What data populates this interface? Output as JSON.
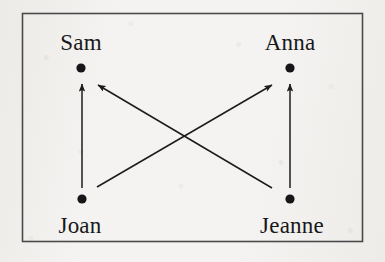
{
  "figure": {
    "kind": "directed-graph-diagram",
    "border": {
      "x": 22,
      "y": 13,
      "width": 341,
      "height": 229,
      "color": "#4a4a4c"
    },
    "ink_color": "#1c1c1e",
    "background_color": "#f4f3f1",
    "nodes": [
      {
        "id": "sam",
        "label": "Sam",
        "dot_x": 81,
        "dot_y": 68,
        "label_x": 81,
        "label_y": 42,
        "label_position": "above"
      },
      {
        "id": "anna",
        "label": "Anna",
        "dot_x": 290,
        "dot_y": 68,
        "label_x": 290,
        "label_y": 42,
        "label_position": "above"
      },
      {
        "id": "joan",
        "label": "Joan",
        "dot_x": 82,
        "dot_y": 199,
        "label_x": 80,
        "label_y": 225,
        "label_position": "below"
      },
      {
        "id": "jeanne",
        "label": "Jeanne",
        "dot_x": 290,
        "dot_y": 199,
        "label_x": 292,
        "label_y": 225,
        "label_position": "below"
      }
    ],
    "edges": [
      {
        "id": "joan-to-sam",
        "from": "joan",
        "to": "sam",
        "x1": 82,
        "y1": 188,
        "x2": 82,
        "y2": 84,
        "shape": "vertical"
      },
      {
        "id": "jeanne-to-anna",
        "from": "jeanne",
        "to": "anna",
        "x1": 290,
        "y1": 188,
        "x2": 290,
        "y2": 84,
        "shape": "vertical"
      },
      {
        "id": "joan-to-anna",
        "from": "joan",
        "to": "anna",
        "x1": 97,
        "y1": 187,
        "x2": 272,
        "y2": 85,
        "shape": "diagonal-up-right"
      },
      {
        "id": "jeanne-to-sam",
        "from": "jeanne",
        "to": "sam",
        "x1": 272,
        "y1": 188,
        "x2": 98,
        "y2": 85,
        "shape": "diagonal-up-left"
      }
    ],
    "crossing_point": {
      "x": 186,
      "y": 135
    }
  }
}
